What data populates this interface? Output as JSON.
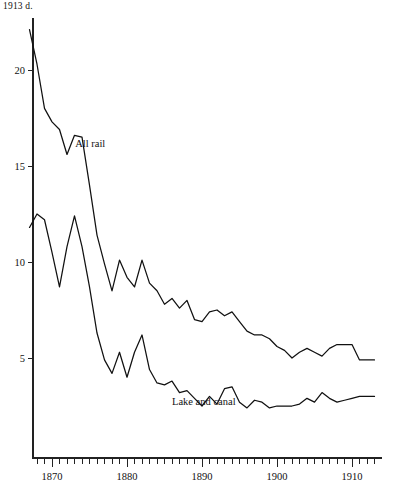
{
  "figure": {
    "unit_label": "1913 d.",
    "background": "#ffffff",
    "line_color": "#111111"
  },
  "chart_data": {
    "type": "line",
    "title": "",
    "subtitle": "",
    "xlabel": "",
    "ylabel": "1913 d.",
    "grid": false,
    "legend": "inline-labels",
    "xlim": [
      1866,
      1913
    ],
    "ylim": [
      0,
      23
    ],
    "x_ticks_major": [
      1870,
      1880,
      1890,
      1900,
      1910
    ],
    "x_tick_labels": [
      "1870",
      "1880",
      "1890",
      "1900",
      "1910"
    ],
    "x_tick_interval_minor": 1,
    "y_ticks": [
      5,
      10,
      15,
      20
    ],
    "y_tick_labels": [
      "5",
      "10",
      "15",
      "20"
    ],
    "annotations": [
      {
        "text": "All rail",
        "x": 1873.1,
        "y": 16.0
      },
      {
        "text": "Lake and canal",
        "x": 1886.0,
        "y": 2.55
      }
    ],
    "series": [
      {
        "name": "All rail",
        "x": [
          1867,
          1868,
          1869,
          1870,
          1871,
          1872,
          1873,
          1874,
          1875,
          1876,
          1877,
          1878,
          1879,
          1880,
          1881,
          1882,
          1883,
          1884,
          1885,
          1886,
          1887,
          1888,
          1889,
          1890,
          1891,
          1892,
          1893,
          1894,
          1895,
          1896,
          1897,
          1898,
          1899,
          1900,
          1901,
          1902,
          1903,
          1904,
          1905,
          1906,
          1907,
          1908,
          1909,
          1910,
          1911,
          1912,
          1913
        ],
        "values": [
          22.1,
          20.3,
          18.0,
          17.3,
          16.9,
          15.6,
          16.6,
          16.5,
          14.0,
          11.4,
          9.9,
          8.5,
          10.1,
          9.2,
          8.7,
          10.1,
          8.9,
          8.5,
          7.8,
          8.1,
          7.6,
          8.0,
          7.0,
          6.9,
          7.4,
          7.5,
          7.2,
          7.4,
          6.9,
          6.4,
          6.2,
          6.2,
          6.0,
          5.6,
          5.4,
          5.0,
          5.3,
          5.5,
          5.3,
          5.1,
          5.5,
          5.7,
          5.7,
          5.7,
          4.9,
          4.9,
          4.9
        ]
      },
      {
        "name": "Lake and canal",
        "x": [
          1867,
          1868,
          1869,
          1870,
          1871,
          1872,
          1873,
          1874,
          1875,
          1876,
          1877,
          1878,
          1879,
          1880,
          1881,
          1882,
          1883,
          1884,
          1885,
          1886,
          1887,
          1888,
          1889,
          1890,
          1891,
          1892,
          1893,
          1894,
          1895,
          1896,
          1897,
          1898,
          1899,
          1900,
          1901,
          1902,
          1903,
          1904,
          1905,
          1906,
          1907,
          1908,
          1909,
          1910,
          1911,
          1912,
          1913
        ],
        "values": [
          11.8,
          12.5,
          12.2,
          10.5,
          8.7,
          10.8,
          12.4,
          10.8,
          8.7,
          6.3,
          4.9,
          4.2,
          5.3,
          4.0,
          5.3,
          6.2,
          4.4,
          3.7,
          3.6,
          3.8,
          3.2,
          3.3,
          2.9,
          2.5,
          3.0,
          2.6,
          3.4,
          3.5,
          2.7,
          2.4,
          2.8,
          2.7,
          2.4,
          2.5,
          2.5,
          2.5,
          2.6,
          2.9,
          2.7,
          3.2,
          2.9,
          2.7,
          2.8,
          2.9,
          3.0,
          3.0,
          3.0
        ]
      }
    ]
  }
}
